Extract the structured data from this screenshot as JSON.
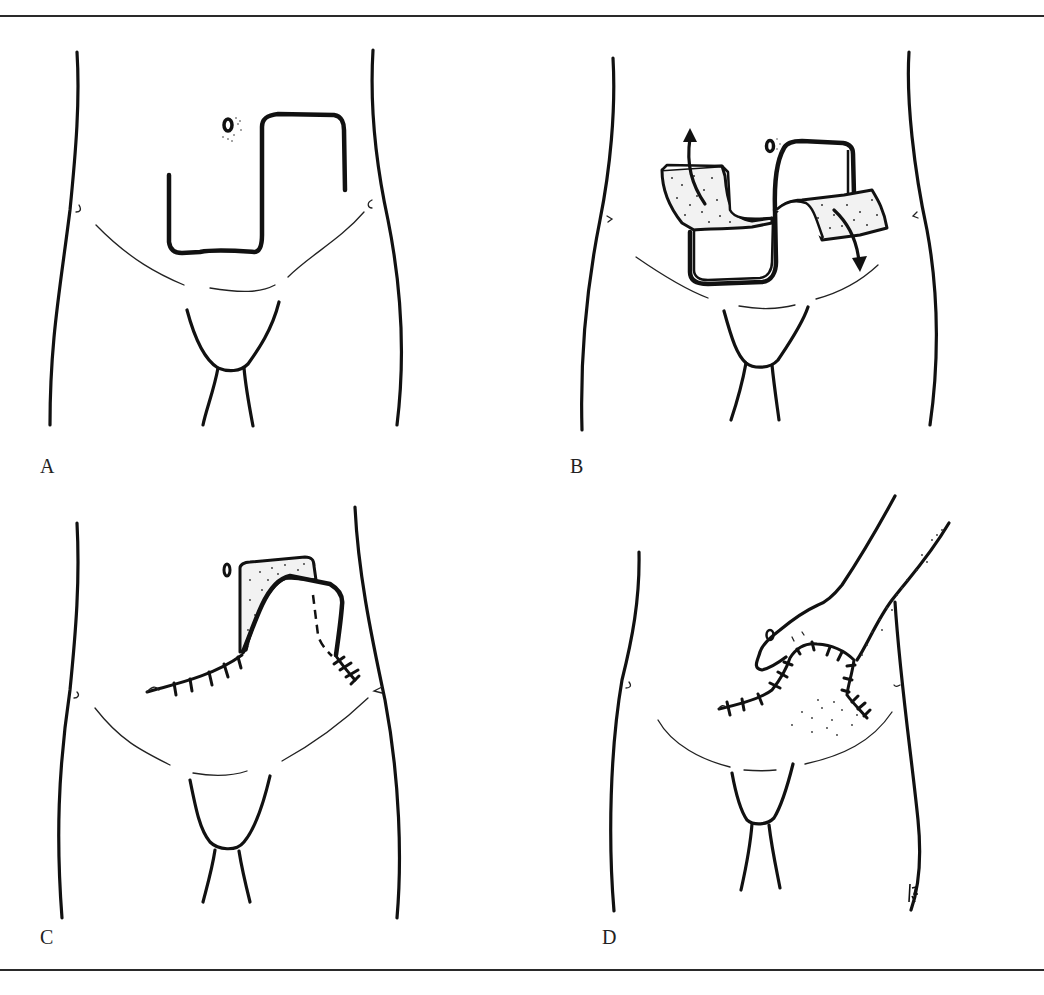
{
  "figure": {
    "panels": [
      {
        "id": "A",
        "label": "A",
        "description": "Z-shaped (step) incision outlined on lower abdomen beside umbilicus"
      },
      {
        "id": "B",
        "label": "B",
        "description": "Skin flaps raised and transposed, arrows show direction of rotation"
      },
      {
        "id": "C",
        "label": "C",
        "description": "Flap transposed and sutured; dashed line marks flap border"
      },
      {
        "id": "D",
        "label": "D",
        "description": "Hand palpating sutured closure with shaded area of induration"
      }
    ],
    "signature": "GJ",
    "icons": {
      "arrow_up": "arrow-up-icon",
      "arrow_down": "arrow-down-icon"
    },
    "colors": {
      "line": "#111111",
      "rule": "#2a2a2a",
      "background": "#ffffff",
      "stipple": "#333333"
    }
  }
}
